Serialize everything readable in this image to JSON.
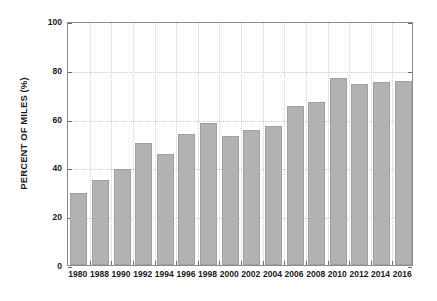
{
  "chart_data": {
    "type": "bar",
    "title": "",
    "subtitle": "",
    "xlabel": "",
    "ylabel": "PERCENT OF MILES (%)",
    "ylim": [
      0,
      100
    ],
    "ytick_labels": [
      "0",
      "20",
      "40",
      "60",
      "80",
      "100"
    ],
    "ytick_values": [
      0,
      20,
      40,
      60,
      80,
      100
    ],
    "grid": "horizontal-and-vertical-dotted",
    "legend": "none",
    "bar_color": "#b2b2b2",
    "categories": [
      "1980",
      "1988",
      "1990",
      "1992",
      "1994",
      "1996",
      "1998",
      "2000",
      "2002",
      "2004",
      "2006",
      "2008",
      "2010",
      "2012",
      "2014",
      "2016"
    ],
    "values": [
      29.5,
      35.0,
      39.5,
      50.0,
      45.5,
      53.5,
      58.0,
      53.0,
      55.5,
      57.0,
      65.0,
      67.0,
      76.5,
      74.0,
      75.0,
      75.5
    ],
    "series": [
      {
        "name": "Percent of miles",
        "values": [
          29.5,
          35.0,
          39.5,
          50.0,
          45.5,
          53.5,
          58.0,
          53.0,
          55.5,
          57.0,
          65.0,
          67.0,
          76.5,
          74.0,
          75.0,
          75.5
        ]
      }
    ]
  }
}
